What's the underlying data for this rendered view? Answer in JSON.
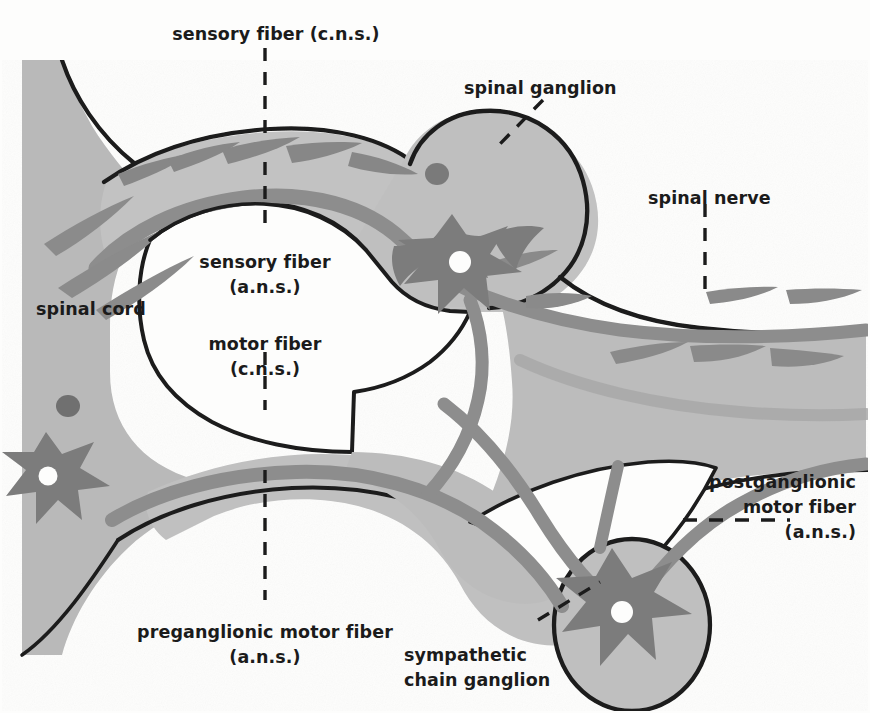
{
  "figure": {
    "background_color": "#fdfdfc",
    "tissue_fill": "#b9b9b9",
    "tissue_fill_light": "#c6c6c6",
    "fiber_band": "#8f8f8f",
    "neuron_body": "#7e7e7e",
    "outline_color": "#1d1d1d",
    "void_fill": "#fdfdfc",
    "label_color": "#1b1b1b"
  },
  "labels": {
    "sensory_fiber_cns": {
      "text": "sensory fiber (c.n.s.)",
      "x": 276,
      "y": 22,
      "align": "center"
    },
    "spinal_ganglion": {
      "text": "spinal ganglion",
      "x": 464,
      "y": 76,
      "align": "left"
    },
    "spinal_nerve": {
      "text": "spinal nerve",
      "x": 648,
      "y": 186,
      "align": "left"
    },
    "sensory_fiber_ans": {
      "line1": "sensory fiber",
      "line2": "(a.n.s.)",
      "x": 265,
      "y": 250,
      "align": "center"
    },
    "spinal_cord": {
      "text": "spinal cord",
      "x": 36,
      "y": 297,
      "align": "left"
    },
    "motor_fiber_cns": {
      "line1": "motor fiber",
      "line2": "(c.n.s.)",
      "x": 265,
      "y": 332,
      "align": "center"
    },
    "postganglionic_motor_fiber_ans": {
      "line1": "postganglionic",
      "line2": "motor fiber",
      "line3": "(a.n.s.)",
      "x": 856,
      "y": 470,
      "align": "right"
    },
    "preganglionic_motor_fiber_ans": {
      "line1": "preganglionic motor fiber",
      "line2": "(a.n.s.)",
      "x": 265,
      "y": 620,
      "align": "center"
    },
    "sympathetic_chain_ganglion": {
      "line1": "sympathetic",
      "line2": "chain ganglion",
      "x": 404,
      "y": 643,
      "align": "left"
    }
  },
  "structures": [
    {
      "name": "spinal-cord",
      "description": "Grey matter block at left edge with butterfly horn"
    },
    {
      "name": "dorsal-root",
      "description": "Upper root carrying sensory fibers from cord to spinal ganglion"
    },
    {
      "name": "spinal-ganglion",
      "description": "Oval swelling on dorsal root containing sensory neuron cell body"
    },
    {
      "name": "spinal-nerve",
      "description": "Mixed nerve trunk extending to the right edge"
    },
    {
      "name": "ventral-root",
      "description": "Lower root carrying motor fibers out of the cord"
    },
    {
      "name": "sympathetic-chain-ganglion",
      "description": "Round ganglion below the nerve containing postganglionic neuron"
    },
    {
      "name": "sensory-neuron-cell-body",
      "description": "Star-shaped dark neuron with white nucleus in spinal ganglion"
    },
    {
      "name": "motor-neuron-cell-body",
      "description": "Star-shaped dark neuron with white nucleus in ventral horn"
    },
    {
      "name": "postganglionic-neuron-cell-body",
      "description": "Star-shaped dark neuron with white nucleus in chain ganglion"
    },
    {
      "name": "sensory-neuron-nucleus-cord",
      "description": "Small dark round nucleus in spinal cord grey matter"
    },
    {
      "name": "ganglion-neuron-nucleus",
      "description": "Small dark round nucleus inside spinal ganglion"
    }
  ],
  "leader_lines": [
    {
      "name": "sensory-fiber-cns-leader",
      "style": "dashed-vertical"
    },
    {
      "name": "sensory-fiber-ans-leader",
      "style": "dashed-vertical"
    },
    {
      "name": "motor-fiber-cns-leader",
      "style": "dashed-vertical"
    },
    {
      "name": "preganglionic-leader",
      "style": "dashed-vertical"
    },
    {
      "name": "spinal-nerve-leader",
      "style": "dashed-vertical"
    },
    {
      "name": "spinal-ganglion-leader",
      "style": "dashed-diagonal"
    },
    {
      "name": "postganglionic-leader",
      "style": "dashed-horizontal"
    },
    {
      "name": "sympathetic-chain-ganglion-leader",
      "style": "dashed-diagonal"
    }
  ]
}
